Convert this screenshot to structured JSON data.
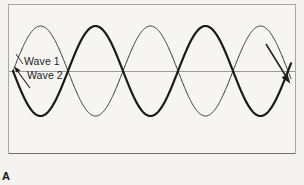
{
  "figure": {
    "panel_letter": "A",
    "background_color": "#f4f3f1",
    "frame": {
      "border_color": "#a8a8a8",
      "fill_color": "#f6f5f3",
      "x": 8,
      "y": 4,
      "width": 288,
      "height": 150
    },
    "axis_line": {
      "name": "zero-axis",
      "color": "#9b9b9b",
      "y": 71
    },
    "labels": [
      {
        "id": "wave1",
        "text": "Wave 1"
      },
      {
        "id": "wave2",
        "text": "Wave 2"
      }
    ],
    "annotations": {
      "wave1_leader_color": "#2a2a2a",
      "wave2_arrow_color": "#1e1e1e",
      "right_arrow_color": "#1e1e1e",
      "right_arrow_name": "propagation-direction-arrow"
    }
  },
  "chart_data": {
    "type": "line",
    "title": "",
    "subtitle": "",
    "xlabel": "",
    "ylabel": "",
    "grid": false,
    "legend_position": "inline-left",
    "axis_line_y": 0,
    "xlim": [
      0,
      2.6
    ],
    "ylim": [
      -1.15,
      1.15
    ],
    "x_units": "wave periods",
    "period_px": 110,
    "amplitude_px": 45,
    "zero_axis_y_px": 71,
    "wave_start_x_px": 13,
    "wave_end_x_px": 291,
    "series": [
      {
        "name": "Wave 1",
        "legend": "Wave 1",
        "style": "thin",
        "stroke_width": 1.0,
        "color": "#333333",
        "amplitude": 1.0,
        "phase_deg": 0,
        "formula": "y = sin(2*pi*x)",
        "x": [
          0,
          0.125,
          0.25,
          0.375,
          0.5,
          0.625,
          0.75,
          0.875,
          1.0,
          1.125,
          1.25,
          1.375,
          1.5,
          1.625,
          1.75,
          1.875,
          2.0,
          2.125,
          2.25,
          2.375,
          2.5
        ],
        "values": [
          0,
          0.707,
          1.0,
          0.707,
          0,
          -0.707,
          -1.0,
          -0.707,
          0,
          0.707,
          1.0,
          0.707,
          0,
          -0.707,
          -1.0,
          -0.707,
          0,
          0.707,
          1.0,
          0.707,
          0
        ]
      },
      {
        "name": "Wave 2",
        "legend": "Wave 2",
        "style": "thick",
        "stroke_width": 2.2,
        "color": "#1a1a1a",
        "amplitude": 1.0,
        "phase_deg": 180,
        "formula": "y = -sin(2*pi*x)",
        "x": [
          0,
          0.125,
          0.25,
          0.375,
          0.5,
          0.625,
          0.75,
          0.875,
          1.0,
          1.125,
          1.25,
          1.375,
          1.5,
          1.625,
          1.75,
          1.875,
          2.0,
          2.125,
          2.25,
          2.375,
          2.5
        ],
        "values": [
          0,
          -0.707,
          -1.0,
          -0.707,
          0,
          0.707,
          1.0,
          0.707,
          0,
          -0.707,
          -1.0,
          -0.707,
          0,
          0.707,
          1.0,
          0.707,
          0,
          -0.707,
          -1.0,
          -0.707,
          0
        ]
      }
    ],
    "crossings_px": [
      68,
      123,
      178,
      233,
      288
    ],
    "annotation_text": "Two sine waves 180 degrees out of phase"
  }
}
